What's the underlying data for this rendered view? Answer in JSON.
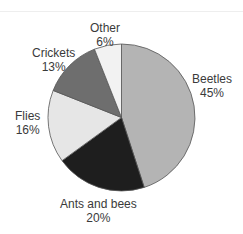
{
  "chart_data": {
    "type": "pie",
    "title": "",
    "start_angle": "12 o'clock",
    "direction": "clockwise",
    "categories": [
      "Beetles",
      "Ants and bees",
      "Flies",
      "Crickets",
      "Other"
    ],
    "values": [
      45,
      20,
      16,
      13,
      6
    ],
    "unit": "%",
    "labels": [
      {
        "name": "Beetles",
        "pct": "45%"
      },
      {
        "name": "Ants and bees",
        "pct": "20%"
      },
      {
        "name": "Flies",
        "pct": "16%"
      },
      {
        "name": "Crickets",
        "pct": "13%"
      },
      {
        "name": "Other",
        "pct": "6%"
      }
    ],
    "colors": [
      "#b4b4b4",
      "#1e1e1e",
      "#e6e6e6",
      "#6e6e6e",
      "#f2f2f2"
    ],
    "legend": "none (labels placed outside slices)"
  }
}
